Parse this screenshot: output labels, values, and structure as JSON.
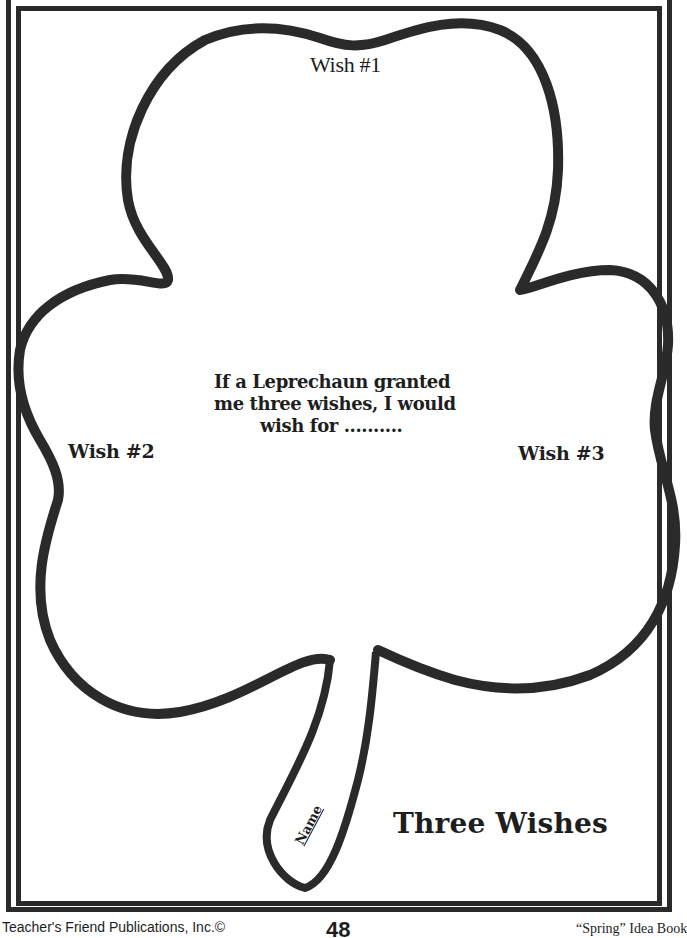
{
  "worksheet": {
    "title": "Three Wishes",
    "prompt": {
      "line1": "If a Leprechaun granted",
      "line2": "me three wishes, I would",
      "line3": "wish for .........."
    },
    "wishes": [
      {
        "label": "Wish #1"
      },
      {
        "label": "Wish #2"
      },
      {
        "label": "Wish #3"
      }
    ],
    "name_label": "Name",
    "shape_icon": "shamrock-outline"
  },
  "footer": {
    "publisher": "Teacher's Friend Publications, Inc.©",
    "page_number": "48",
    "book_title": "“Spring” Idea Book"
  },
  "colors": {
    "ink": "#2a2a2a",
    "paper": "#ffffff"
  }
}
